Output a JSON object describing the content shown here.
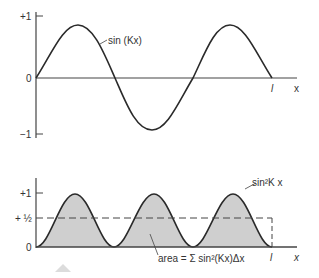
{
  "top_plot": {
    "y_ticks": [
      "+1",
      "0",
      "−1"
    ],
    "curve_label": "sin (Kx)",
    "x_end_label": "l",
    "x_axis_label": "x"
  },
  "bottom_plot": {
    "y_ticks": [
      "+1",
      "+ ½",
      "0"
    ],
    "curve_label": "sin²K x",
    "area_label": "area = Σ sin²(Kx)Δx",
    "x_end_label": "l",
    "x_axis_label": "x"
  },
  "colors": {
    "line": "#2a2a2a",
    "fill": "#cfcfcf",
    "axis": "#555555"
  }
}
